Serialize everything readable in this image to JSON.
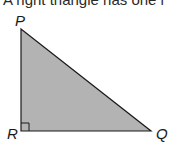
{
  "caption": {
    "text": "A right triangle has one r"
  },
  "triangle": {
    "fill": "#b3b3b3",
    "stroke": "#1a1a1a",
    "vertices": {
      "P": {
        "label": "P",
        "x": 21,
        "y": 29
      },
      "R": {
        "label": "R",
        "x": 21,
        "y": 131
      },
      "Q": {
        "label": "Q",
        "x": 151,
        "y": 131
      }
    },
    "right_angle_at": "R"
  }
}
